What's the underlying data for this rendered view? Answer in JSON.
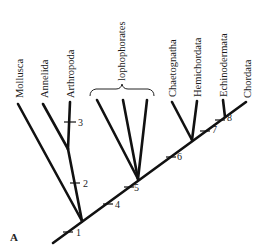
{
  "figure": {
    "panel_label": "A",
    "type": "phylogenetic-tree",
    "line_color": "#111111",
    "background": "#ffffff"
  },
  "taxa": [
    {
      "id": "mollusca",
      "label": "Mollusca"
    },
    {
      "id": "annelida",
      "label": "Annelida"
    },
    {
      "id": "arthropoda",
      "label": "Arthropoda"
    },
    {
      "id": "lophophorates",
      "label": "lophophorates"
    },
    {
      "id": "chaetognatha",
      "label": "Chaetognatha"
    },
    {
      "id": "hemichordata",
      "label": "Hemichordata"
    },
    {
      "id": "echinodermata",
      "label": "Echinodermata"
    },
    {
      "id": "chordata",
      "label": "Chordata"
    }
  ],
  "nodes": [
    {
      "label": "1"
    },
    {
      "label": "2"
    },
    {
      "label": "3"
    },
    {
      "label": "4"
    },
    {
      "label": "5"
    },
    {
      "label": "6"
    },
    {
      "label": "7"
    },
    {
      "label": "8"
    }
  ]
}
